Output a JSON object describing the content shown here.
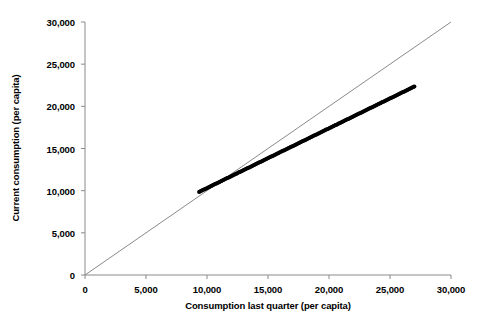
{
  "chart_data": {
    "type": "scatter",
    "title": "",
    "xlabel": "Consumption last quarter (per capita)",
    "ylabel": "Current consumption (per capita)",
    "xlim": [
      0,
      30000
    ],
    "ylim": [
      0,
      30000
    ],
    "grid": false,
    "legend": false,
    "x_ticks": [
      0,
      5000,
      10000,
      15000,
      20000,
      25000,
      30000
    ],
    "y_ticks": [
      0,
      5000,
      10000,
      15000,
      20000,
      25000,
      30000
    ],
    "x_tick_labels": [
      "0",
      "5,000",
      "10,000",
      "15,000",
      "20,000",
      "25,000",
      "30,000"
    ],
    "y_tick_labels": [
      "0",
      "5,000",
      "10,000",
      "15,000",
      "20,000",
      "25,000",
      "30,000"
    ],
    "marker_color": "#000000",
    "marker_size": 4,
    "reference_line": {
      "name": "identity",
      "from": [
        0,
        0
      ],
      "to": [
        30000,
        30000
      ],
      "color": "#8a8a8a",
      "width": 1
    },
    "axis_color": "#8a8a8a",
    "series": [
      {
        "name": "Consumption",
        "points": [
          [
            9350,
            9850
          ],
          [
            9420,
            9900
          ],
          [
            9500,
            9960
          ],
          [
            9580,
            10010
          ],
          [
            9660,
            10070
          ],
          [
            9740,
            10130
          ],
          [
            9820,
            10180
          ],
          [
            9900,
            10240
          ],
          [
            9980,
            10300
          ],
          [
            10060,
            10350
          ],
          [
            10140,
            10410
          ],
          [
            10220,
            10470
          ],
          [
            10300,
            10520
          ],
          [
            10380,
            10580
          ],
          [
            10460,
            10640
          ],
          [
            10540,
            10690
          ],
          [
            10620,
            10750
          ],
          [
            10700,
            10810
          ],
          [
            10780,
            10860
          ],
          [
            10860,
            10920
          ],
          [
            10940,
            10980
          ],
          [
            11020,
            11030
          ],
          [
            11100,
            11090
          ],
          [
            11180,
            11150
          ],
          [
            11260,
            11200
          ],
          [
            11340,
            11260
          ],
          [
            11420,
            11320
          ],
          [
            11500,
            11370
          ],
          [
            11580,
            11430
          ],
          [
            11660,
            11490
          ],
          [
            11740,
            11540
          ],
          [
            11820,
            11600
          ],
          [
            11900,
            11660
          ],
          [
            11980,
            11710
          ],
          [
            12060,
            11770
          ],
          [
            12140,
            11830
          ],
          [
            12220,
            11880
          ],
          [
            12300,
            11940
          ],
          [
            12380,
            12000
          ],
          [
            12460,
            12050
          ],
          [
            12540,
            12110
          ],
          [
            12620,
            12170
          ],
          [
            12700,
            12220
          ],
          [
            12780,
            12280
          ],
          [
            12860,
            12340
          ],
          [
            12940,
            12390
          ],
          [
            13020,
            12450
          ],
          [
            13100,
            12510
          ],
          [
            13180,
            12560
          ],
          [
            13260,
            12620
          ],
          [
            13340,
            12680
          ],
          [
            13420,
            12730
          ],
          [
            13500,
            12790
          ],
          [
            13580,
            12850
          ],
          [
            13660,
            12900
          ],
          [
            13740,
            12960
          ],
          [
            13820,
            13020
          ],
          [
            13900,
            13070
          ],
          [
            13980,
            13130
          ],
          [
            14060,
            13190
          ],
          [
            14140,
            13240
          ],
          [
            14220,
            13300
          ],
          [
            14300,
            13360
          ],
          [
            14380,
            13410
          ],
          [
            14460,
            13470
          ],
          [
            14540,
            13530
          ],
          [
            14620,
            13580
          ],
          [
            14700,
            13640
          ],
          [
            14780,
            13700
          ],
          [
            14860,
            13750
          ],
          [
            14940,
            13810
          ],
          [
            15020,
            13870
          ],
          [
            15100,
            13920
          ],
          [
            15180,
            13980
          ],
          [
            15260,
            14040
          ],
          [
            15340,
            14090
          ],
          [
            15420,
            14150
          ],
          [
            15500,
            14210
          ],
          [
            15580,
            14260
          ],
          [
            15660,
            14320
          ],
          [
            15740,
            14380
          ],
          [
            15820,
            14430
          ],
          [
            15900,
            14490
          ],
          [
            15980,
            14550
          ],
          [
            16060,
            14600
          ],
          [
            16140,
            14660
          ],
          [
            16220,
            14720
          ],
          [
            16300,
            14770
          ],
          [
            16380,
            14830
          ],
          [
            16460,
            14890
          ],
          [
            16540,
            14940
          ],
          [
            16620,
            15000
          ],
          [
            16700,
            15060
          ],
          [
            16780,
            15110
          ],
          [
            16860,
            15170
          ],
          [
            16940,
            15230
          ],
          [
            17020,
            15280
          ],
          [
            17100,
            15340
          ],
          [
            17180,
            15400
          ],
          [
            17260,
            15450
          ],
          [
            17340,
            15510
          ],
          [
            17420,
            15570
          ],
          [
            17500,
            15620
          ],
          [
            17580,
            15680
          ],
          [
            17660,
            15740
          ],
          [
            17740,
            15790
          ],
          [
            17820,
            15850
          ],
          [
            17900,
            15910
          ],
          [
            17980,
            15960
          ],
          [
            18060,
            16020
          ],
          [
            18140,
            16080
          ],
          [
            18220,
            16130
          ],
          [
            18300,
            16190
          ],
          [
            18380,
            16250
          ],
          [
            18460,
            16300
          ],
          [
            18540,
            16360
          ],
          [
            18620,
            16420
          ],
          [
            18700,
            16470
          ],
          [
            18780,
            16530
          ],
          [
            18860,
            16590
          ],
          [
            18940,
            16640
          ],
          [
            19020,
            16700
          ],
          [
            19100,
            16760
          ],
          [
            19180,
            16810
          ],
          [
            19260,
            16870
          ],
          [
            19340,
            16930
          ],
          [
            19420,
            16980
          ],
          [
            19500,
            17040
          ],
          [
            19580,
            17100
          ],
          [
            19660,
            17150
          ],
          [
            19740,
            17210
          ],
          [
            19820,
            17270
          ],
          [
            19900,
            17320
          ],
          [
            19980,
            17380
          ],
          [
            20060,
            17440
          ],
          [
            20140,
            17490
          ],
          [
            20220,
            17550
          ],
          [
            20300,
            17610
          ],
          [
            20380,
            17660
          ],
          [
            20460,
            17720
          ],
          [
            20540,
            17780
          ],
          [
            20620,
            17830
          ],
          [
            20700,
            17890
          ],
          [
            20780,
            17950
          ],
          [
            20860,
            18000
          ],
          [
            20940,
            18060
          ],
          [
            21020,
            18120
          ],
          [
            21100,
            18170
          ],
          [
            21180,
            18230
          ],
          [
            21260,
            18290
          ],
          [
            21340,
            18340
          ],
          [
            21420,
            18400
          ],
          [
            21500,
            18460
          ],
          [
            21580,
            18510
          ],
          [
            21660,
            18570
          ],
          [
            21740,
            18630
          ],
          [
            21820,
            18680
          ],
          [
            21900,
            18740
          ],
          [
            21980,
            18800
          ],
          [
            22060,
            18850
          ],
          [
            22140,
            18910
          ],
          [
            22220,
            18970
          ],
          [
            22300,
            19020
          ],
          [
            22380,
            19080
          ],
          [
            22460,
            19140
          ],
          [
            22540,
            19190
          ],
          [
            22620,
            19250
          ],
          [
            22700,
            19310
          ],
          [
            22780,
            19360
          ],
          [
            22860,
            19420
          ],
          [
            22940,
            19480
          ],
          [
            23020,
            19530
          ],
          [
            23100,
            19590
          ],
          [
            23180,
            19650
          ],
          [
            23260,
            19700
          ],
          [
            23340,
            19760
          ],
          [
            23420,
            19820
          ],
          [
            23500,
            19870
          ],
          [
            23580,
            19930
          ],
          [
            23660,
            19990
          ],
          [
            23740,
            20040
          ],
          [
            23820,
            20100
          ],
          [
            23900,
            20160
          ],
          [
            23980,
            20210
          ],
          [
            24060,
            20270
          ],
          [
            24140,
            20330
          ],
          [
            24220,
            20380
          ],
          [
            24300,
            20440
          ],
          [
            24380,
            20500
          ],
          [
            24460,
            20550
          ],
          [
            24540,
            20610
          ],
          [
            24620,
            20670
          ],
          [
            24700,
            20720
          ],
          [
            24780,
            20780
          ],
          [
            24860,
            20840
          ],
          [
            24940,
            20890
          ],
          [
            25020,
            20950
          ],
          [
            25100,
            21010
          ],
          [
            25180,
            21060
          ],
          [
            25260,
            21120
          ],
          [
            25340,
            21180
          ],
          [
            25420,
            21230
          ],
          [
            25500,
            21290
          ],
          [
            25580,
            21350
          ],
          [
            25660,
            21400
          ],
          [
            25740,
            21460
          ],
          [
            25820,
            21520
          ],
          [
            25900,
            21570
          ],
          [
            25980,
            21630
          ],
          [
            26060,
            21690
          ],
          [
            26140,
            21740
          ],
          [
            26220,
            21800
          ],
          [
            26300,
            21860
          ],
          [
            26380,
            21910
          ],
          [
            26460,
            21970
          ],
          [
            26540,
            22030
          ],
          [
            26620,
            22080
          ],
          [
            26700,
            22140
          ],
          [
            26780,
            22200
          ],
          [
            26860,
            22250
          ],
          [
            26940,
            22310
          ],
          [
            27000,
            22350
          ]
        ],
        "x_range": [
          9350,
          27000
        ],
        "y_range": [
          9850,
          26300
        ],
        "n_points": 222,
        "description": "Dense near-linear band of points lying just below the 45-degree identity line"
      }
    ]
  },
  "axes": {
    "x_title": "Consumption last quarter (per capita)",
    "y_title": "Current consumption (per capita)"
  }
}
